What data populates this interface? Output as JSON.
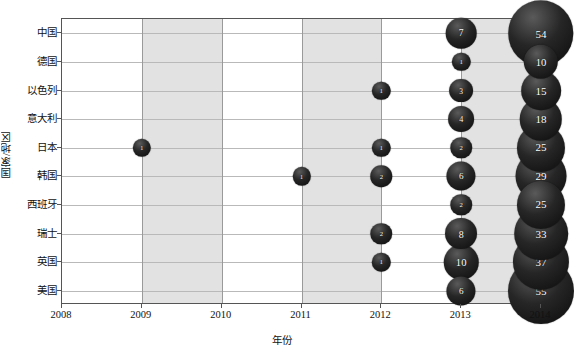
{
  "chart_data": {
    "type": "scatter",
    "title": "",
    "xlabel": "年份",
    "ylabel": "国家/地区",
    "grid": true,
    "legend": "none",
    "xlim": [
      2008,
      2014
    ],
    "x_ticks": [
      "2008",
      "2009",
      "2010",
      "2011",
      "2012",
      "2013",
      "2014"
    ],
    "categories": [
      "中国",
      "德国",
      "以色列",
      "意大利",
      "日本",
      "韩国",
      "西班牙",
      "瑞士",
      "英国",
      "美国"
    ],
    "bubble_note": "Each marker is labelled with its numeric value; marker area scales with the value.",
    "points": [
      {
        "country": "中国",
        "year": 2013,
        "value": 7
      },
      {
        "country": "中国",
        "year": 2014,
        "value": 54
      },
      {
        "country": "德国",
        "year": 2013,
        "value": 1
      },
      {
        "country": "德国",
        "year": 2014,
        "value": 10
      },
      {
        "country": "以色列",
        "year": 2012,
        "value": 1
      },
      {
        "country": "以色列",
        "year": 2013,
        "value": 3
      },
      {
        "country": "以色列",
        "year": 2014,
        "value": 15
      },
      {
        "country": "意大利",
        "year": 2013,
        "value": 4
      },
      {
        "country": "意大利",
        "year": 2014,
        "value": 18
      },
      {
        "country": "日本",
        "year": 2009,
        "value": 1
      },
      {
        "country": "日本",
        "year": 2012,
        "value": 1
      },
      {
        "country": "日本",
        "year": 2013,
        "value": 2
      },
      {
        "country": "日本",
        "year": 2014,
        "value": 25
      },
      {
        "country": "韩国",
        "year": 2011,
        "value": 1
      },
      {
        "country": "韩国",
        "year": 2012,
        "value": 2
      },
      {
        "country": "韩国",
        "year": 2013,
        "value": 6
      },
      {
        "country": "韩国",
        "year": 2014,
        "value": 29
      },
      {
        "country": "西班牙",
        "year": 2013,
        "value": 2
      },
      {
        "country": "西班牙",
        "year": 2014,
        "value": 25
      },
      {
        "country": "瑞士",
        "year": 2012,
        "value": 2
      },
      {
        "country": "瑞士",
        "year": 2013,
        "value": 8
      },
      {
        "country": "瑞士",
        "year": 2014,
        "value": 33
      },
      {
        "country": "英国",
        "year": 2012,
        "value": 1
      },
      {
        "country": "英国",
        "year": 2013,
        "value": 10
      },
      {
        "country": "英国",
        "year": 2014,
        "value": 37
      },
      {
        "country": "美国",
        "year": 2013,
        "value": 6
      },
      {
        "country": "美国",
        "year": 2014,
        "value": 55
      }
    ]
  },
  "style": {
    "band_color": "#e2e2e2",
    "grid_color": "#b9b9b9",
    "axis_color": "#555555",
    "bubble_color": "#1a1a1a",
    "bubble_label_color": "#ffffff"
  }
}
